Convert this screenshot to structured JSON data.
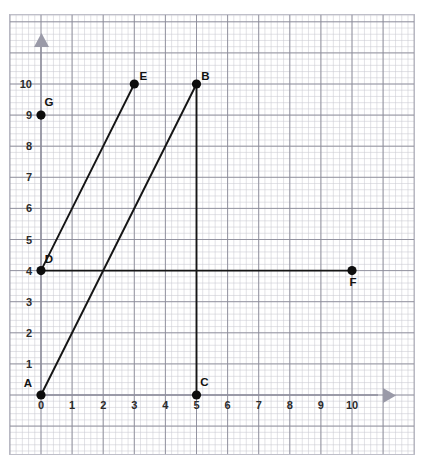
{
  "chart_data": {
    "type": "scatter",
    "title": "",
    "xlabel": "",
    "ylabel": "",
    "xlim": [
      0,
      10
    ],
    "ylim": [
      0,
      10
    ],
    "grid": true,
    "grid_minor_per_major": 5,
    "legend": "none",
    "x_ticks": [
      "0",
      "1",
      "2",
      "3",
      "4",
      "5",
      "6",
      "7",
      "8",
      "9",
      "10"
    ],
    "y_ticks": [
      "1",
      "2",
      "3",
      "4",
      "5",
      "6",
      "7",
      "8",
      "9",
      "10"
    ],
    "points": [
      {
        "label": "A",
        "x": 0,
        "y": 0,
        "label_dx": -13,
        "label_dy": -8
      },
      {
        "label": "B",
        "x": 5,
        "y": 10,
        "label_dx": 9,
        "label_dy": -4
      },
      {
        "label": "C",
        "x": 5,
        "y": 0,
        "label_dx": 8,
        "label_dy": -9
      },
      {
        "label": "D",
        "x": 0,
        "y": 4,
        "label_dx": 8,
        "label_dy": -8
      },
      {
        "label": "E",
        "x": 3,
        "y": 10,
        "label_dx": 9,
        "label_dy": -4
      },
      {
        "label": "F",
        "x": 10,
        "y": 4,
        "label_dx": 1,
        "label_dy": 15
      },
      {
        "label": "G",
        "x": 0,
        "y": 9,
        "label_dx": 8,
        "label_dy": -9
      }
    ],
    "segments": [
      {
        "name": "AB",
        "from": "A",
        "to": "B"
      },
      {
        "name": "BC",
        "from": "B",
        "to": "C"
      },
      {
        "name": "DE",
        "from": "D",
        "to": "E"
      },
      {
        "name": "DF",
        "from": "D",
        "to": "F"
      }
    ],
    "colors": {
      "segment": "#151515",
      "point": "#0d0d0d",
      "grid_minor": "#c9c9d2",
      "grid_major": "#8b8b99",
      "axis": "#9a9aa8",
      "tick_text": "#2b2b2b"
    }
  }
}
